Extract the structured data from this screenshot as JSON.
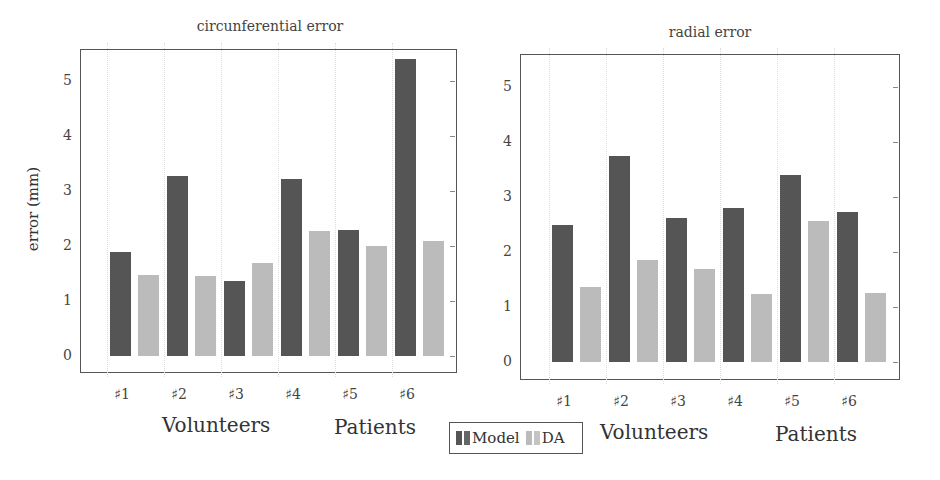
{
  "chart_data": [
    {
      "type": "bar",
      "title": "circunferential error",
      "xlabel": "",
      "ylabel": "error (mm)",
      "ylim": [
        -0.25,
        5.5
      ],
      "yticks": [
        0,
        1,
        2,
        3,
        4,
        5
      ],
      "categories": [
        "♯1",
        "♯2",
        "♯3",
        "♯4",
        "♯5",
        "♯6"
      ],
      "category_groups": [
        {
          "label": "Volunteers",
          "members": [
            "♯1",
            "♯2",
            "♯3",
            "♯4"
          ]
        },
        {
          "label": "Patients",
          "members": [
            "♯5",
            "♯6"
          ]
        }
      ],
      "series": [
        {
          "name": "Model",
          "color": "#555555",
          "values": [
            1.9,
            3.27,
            1.37,
            3.22,
            2.29,
            5.4
          ]
        },
        {
          "name": "DA",
          "color": "#bbbbbb",
          "values": [
            1.47,
            1.45,
            1.7,
            2.27,
            2.0,
            2.1
          ]
        }
      ],
      "grid": "vertical dotted"
    },
    {
      "type": "bar",
      "title": "radial error",
      "xlabel": "",
      "ylabel": "",
      "ylim": [
        -0.25,
        5.5
      ],
      "yticks": [
        0,
        1,
        2,
        3,
        4,
        5
      ],
      "categories": [
        "♯1",
        "♯2",
        "♯3",
        "♯4",
        "♯5",
        "♯6"
      ],
      "category_groups": [
        {
          "label": "Volunteers",
          "members": [
            "♯1",
            "♯2",
            "♯3",
            "♯4"
          ]
        },
        {
          "label": "Patients",
          "members": [
            "♯5",
            "♯6"
          ]
        }
      ],
      "series": [
        {
          "name": "Model",
          "color": "#555555",
          "values": [
            2.5,
            3.75,
            2.62,
            2.8,
            3.4,
            2.73
          ]
        },
        {
          "name": "DA",
          "color": "#bbbbbb",
          "values": [
            1.37,
            1.85,
            1.7,
            1.24,
            2.57,
            1.26
          ]
        }
      ],
      "grid": "vertical dotted"
    }
  ],
  "legend": {
    "position": "bottom-center",
    "items": [
      {
        "label": "Model",
        "color": "#555555"
      },
      {
        "label": "DA",
        "color": "#bbbbbb"
      }
    ]
  },
  "panels": [
    {
      "title": "circunferential error",
      "ylabel": "error (mm)",
      "groups": [
        "Volunteers",
        "Patients"
      ]
    },
    {
      "title": "radial error",
      "ylabel": "",
      "groups": [
        "Volunteers",
        "Patients"
      ]
    }
  ]
}
